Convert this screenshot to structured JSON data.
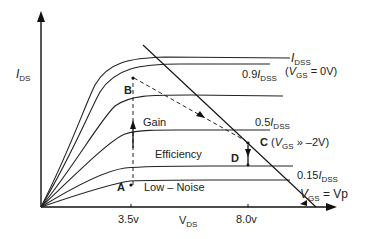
{
  "axes": {
    "y_label_main": "I",
    "y_label_sub": "DS",
    "x_label_main": "V",
    "x_label_sub": "DS",
    "x_ticks": [
      "3.5v",
      "8.0v"
    ]
  },
  "curves": [
    {
      "id": "idss",
      "label_main": "I",
      "label_sub": "DSS",
      "note_open": "(",
      "note_v": "V",
      "note_sub": "GS",
      "note_rest": " = 0V)"
    },
    {
      "id": "0.9idss",
      "label_prefix": "0.9",
      "label_main": "I",
      "label_sub": "DSS"
    },
    {
      "id": "mid",
      "label_prefix": ""
    },
    {
      "id": "0.5idss",
      "label_prefix": "0.5",
      "label_main": "I",
      "label_sub": "DSS"
    },
    {
      "id": "0.15idss",
      "label_prefix": "0.15",
      "label_main": "I",
      "label_sub": "DSS"
    },
    {
      "id": "vp",
      "label_v": "V",
      "label_sub": "GS",
      "label_rest": " = Vp"
    }
  ],
  "points": {
    "A": "A",
    "B": "B",
    "C": "C",
    "C_note_open": "(",
    "C_note_v": "V",
    "C_note_sub": "GS",
    "C_note_rest": " » –2V)",
    "D": "D"
  },
  "regions": {
    "gain": "Gain",
    "efficiency": "Efficiency",
    "low_noise": "Low – Noise"
  }
}
